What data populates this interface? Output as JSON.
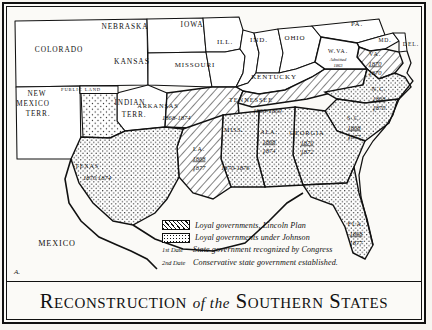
{
  "title": {
    "line": "RECONSTRUCTION of the SOUTHERN STATES",
    "cap_a": "R",
    "rest_a": "ECONSTRUCTION",
    "mid": "of the",
    "cap_b": "S",
    "rest_b": "OUTHERN",
    "cap_c": "S",
    "rest_c": "TATES"
  },
  "plate_signature": "A.",
  "legend": {
    "rows": [
      {
        "key": "hatch",
        "swatch": "diagonal-hatch",
        "text": "Loyal governments, Lincoln Plan"
      },
      {
        "key": "stipple",
        "swatch": "dot-stipple",
        "text": "Loyal governments under Johnson"
      },
      {
        "key": "date1",
        "swatch": "1st Date",
        "text": "State government recognized by Congress"
      },
      {
        "key": "date2",
        "swatch": "2nd Date",
        "text": "Conservative state government established."
      }
    ]
  },
  "colors": {
    "ink": "#111111",
    "paper": "#fbfaf7",
    "hatch_fill": "#ffffff",
    "stipple_fill": "#ffffff",
    "plain_fill": "#ffffff"
  },
  "map": {
    "non_reconstruction_labels": [
      {
        "name": "COLORADO",
        "x": 52,
        "y": 45,
        "size": 7.4
      },
      {
        "name": "NEBRASKA",
        "x": 118,
        "y": 22,
        "size": 7.4
      },
      {
        "name": "IOWA",
        "x": 185,
        "y": 20,
        "size": 7.4
      },
      {
        "name": "ILL.",
        "x": 218,
        "y": 37,
        "size": 7.0
      },
      {
        "name": "IND.",
        "x": 252,
        "y": 35,
        "size": 7.0
      },
      {
        "name": "OHIO",
        "x": 288,
        "y": 33,
        "size": 7.0
      },
      {
        "name": "PA.",
        "x": 350,
        "y": 19,
        "size": 6.6
      },
      {
        "name": "MD.",
        "x": 378,
        "y": 35,
        "size": 5.6
      },
      {
        "name": "DEL.",
        "x": 404,
        "y": 39,
        "size": 5.8
      },
      {
        "name": "KANSAS",
        "x": 125,
        "y": 57,
        "size": 7.6
      },
      {
        "name": "MISSOURI",
        "x": 188,
        "y": 60,
        "size": 7.0
      },
      {
        "name": "KENTUCKY",
        "x": 267,
        "y": 72,
        "size": 7.0
      },
      {
        "name": "NEW",
        "x": 30,
        "y": 89,
        "size": 7.2
      },
      {
        "name": "MEXICO",
        "x": 26,
        "y": 99,
        "size": 7.2
      },
      {
        "name": "TERR.",
        "x": 31,
        "y": 109,
        "size": 7.2
      },
      {
        "name": "INDIAN",
        "x": 123,
        "y": 98,
        "size": 7.2
      },
      {
        "name": "TERR.",
        "x": 127,
        "y": 110,
        "size": 7.2
      },
      {
        "name": "PUBLIC LAND",
        "x": 74,
        "y": 84,
        "size": 4.6
      },
      {
        "name": "MEXICO",
        "x": 50,
        "y": 239,
        "size": 8.2
      }
    ],
    "west_virginia": {
      "name": "W.VA.",
      "note_line1": "Admitted",
      "note_line2": "1863",
      "x": 331,
      "y": 46
    },
    "reconstruction_states": [
      {
        "abbr": "VA.",
        "fill": "hatch",
        "label_x": 368,
        "label_y": 49,
        "date1": "1870",
        "date2": "1870",
        "date2_star": true,
        "stack": true
      },
      {
        "abbr": "N.C.",
        "fill": "stipple",
        "label_x": 372,
        "label_y": 84,
        "date1": "1868",
        "date2": "1870",
        "date2_star": true,
        "stack": true
      },
      {
        "abbr": "S.C.",
        "fill": "stipple",
        "label_x": 347,
        "label_y": 113,
        "date1": "1868",
        "date2": "1877",
        "date2_star": true,
        "stack": true
      },
      {
        "abbr": "GEORGIA",
        "fill": "stipple",
        "label_x": 300,
        "label_y": 128,
        "date1": "1870",
        "date2": "1872",
        "date2_star": true,
        "stack": true
      },
      {
        "abbr": "ALA.",
        "fill": "stipple",
        "label_x": 262,
        "label_y": 127,
        "date1": "1868",
        "date2": "1874",
        "date2_star": true,
        "stack": true
      },
      {
        "abbr": "MISS.",
        "fill": "stipple",
        "label_x": 227,
        "label_y": 125,
        "date1": "1870",
        "date2": "1876",
        "dates_inline": "1870-1876",
        "inline_x": 214,
        "inline_y": 163,
        "stack": false
      },
      {
        "abbr": "LA.",
        "fill": "hatch",
        "label_x": 192,
        "label_y": 144,
        "date1": "1868",
        "date2": "1877",
        "date2_star": true,
        "stack": true
      },
      {
        "abbr": "ARKANSAS",
        "fill": "hatch",
        "label_x": 151,
        "label_y": 101,
        "dates_inline": "1868-1874",
        "inline_x": 155,
        "inline_y": 113,
        "stack": false
      },
      {
        "abbr": "TENNESSEE",
        "fill": "hatch",
        "label_x": 244,
        "label_y": 95,
        "dates_inline": "1866-1869",
        "inline_x": 246,
        "inline_y": 106,
        "stack": false
      },
      {
        "abbr": "TEXAS",
        "fill": "stipple",
        "label_x": 80,
        "label_y": 161,
        "dates_inline": "1870  1874",
        "inline_x": 76,
        "inline_y": 173,
        "stack": false
      },
      {
        "abbr": "FLA.",
        "fill": "stipple",
        "label_x": 349,
        "label_y": 219,
        "date1": "1868",
        "date2": "1877",
        "date2_star": true,
        "stack": true
      }
    ]
  }
}
